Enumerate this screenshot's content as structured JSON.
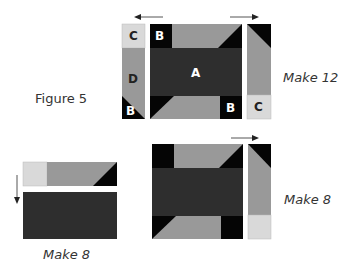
{
  "figure": {
    "title": "Figure 5"
  },
  "colors": {
    "dark": "#2e2e2e",
    "black": "#050505",
    "medium": "#999999",
    "light": "#d9d9d9",
    "arrow": "#333333",
    "letter_on_dark": "#ffffff",
    "letter_on_light": "#222222"
  },
  "top_unit": {
    "left_strip": {
      "pieces": [
        "C",
        "D",
        "B"
      ]
    },
    "center_block": {
      "pieces": [
        "B",
        "A",
        "B"
      ]
    },
    "right_strip": {
      "pieces": [
        "C"
      ]
    },
    "press_arrows": [
      "left",
      "right"
    ],
    "quantity_label": "Make 12"
  },
  "bottom_left_unit": {
    "press_arrow": "down",
    "quantity_label": "Make 8"
  },
  "bottom_right_unit": {
    "press_arrow": "right",
    "quantity_label": "Make 8"
  }
}
